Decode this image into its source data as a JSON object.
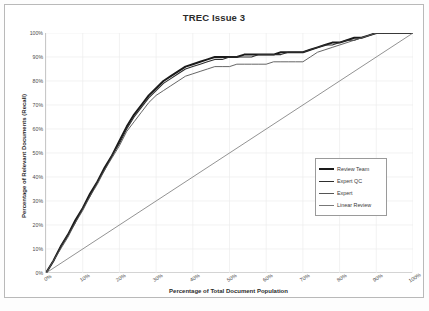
{
  "chart_data": {
    "type": "line",
    "title": "TREC Issue 3",
    "xlabel": "Percentage of Total Document Population",
    "ylabel": "Percentage of Relevant Documents (Recall)",
    "xlim": [
      0,
      100
    ],
    "ylim": [
      0,
      100
    ],
    "grid": true,
    "legend_position": "right-center",
    "xticks": [
      "0%",
      "10%",
      "20%",
      "30%",
      "40%",
      "50%",
      "60%",
      "70%",
      "80%",
      "90%",
      "100%"
    ],
    "yticks": [
      "0%",
      "10%",
      "20%",
      "30%",
      "40%",
      "50%",
      "60%",
      "70%",
      "80%",
      "90%",
      "100%"
    ],
    "series": [
      {
        "name": "Review Team",
        "color": "#1a1a1a",
        "width": 2.0,
        "x": [
          0,
          2,
          4,
          6,
          8,
          10,
          12,
          14,
          16,
          18,
          20,
          22,
          24,
          26,
          28,
          30,
          32,
          34,
          36,
          38,
          40,
          42,
          44,
          46,
          48,
          50,
          52,
          54,
          56,
          58,
          60,
          62,
          64,
          66,
          68,
          70,
          72,
          74,
          76,
          78,
          80,
          82,
          84,
          86,
          88,
          90,
          92,
          94,
          96,
          98,
          100
        ],
        "y": [
          0,
          5,
          11,
          16,
          22,
          27,
          33,
          38,
          44,
          49,
          55,
          61,
          66,
          70,
          74,
          77,
          80,
          82,
          84,
          86,
          87,
          88,
          89,
          90,
          90,
          90,
          90,
          91,
          91,
          91,
          91,
          91,
          92,
          92,
          92,
          92,
          93,
          94,
          95,
          96,
          96,
          97,
          98,
          98,
          99,
          100,
          100,
          100,
          100,
          100,
          100
        ]
      },
      {
        "name": "Expert QC",
        "color": "#2e2e2e",
        "width": 1.1,
        "x": [
          0,
          2,
          4,
          6,
          8,
          10,
          12,
          14,
          16,
          18,
          20,
          22,
          24,
          26,
          28,
          30,
          32,
          34,
          36,
          38,
          40,
          42,
          44,
          46,
          48,
          50,
          52,
          54,
          56,
          58,
          60,
          62,
          64,
          66,
          68,
          70,
          72,
          74,
          76,
          78,
          80,
          82,
          84,
          86,
          88,
          90,
          92,
          94,
          96,
          98,
          100
        ],
        "y": [
          0,
          5,
          11,
          16,
          21,
          27,
          32,
          38,
          43,
          49,
          54,
          60,
          65,
          69,
          73,
          76,
          79,
          81,
          83,
          85,
          86,
          87,
          88,
          89,
          89,
          90,
          90,
          90,
          90,
          91,
          91,
          91,
          91,
          92,
          92,
          92,
          93,
          94,
          95,
          95,
          96,
          97,
          97,
          98,
          99,
          100,
          100,
          100,
          100,
          100,
          100
        ]
      },
      {
        "name": "Expert",
        "color": "#555555",
        "width": 0.9,
        "x": [
          0,
          2,
          4,
          6,
          8,
          10,
          12,
          14,
          16,
          18,
          20,
          22,
          24,
          26,
          28,
          30,
          32,
          34,
          36,
          38,
          40,
          42,
          44,
          46,
          48,
          50,
          52,
          54,
          56,
          58,
          60,
          62,
          64,
          66,
          68,
          70,
          72,
          74,
          76,
          78,
          80,
          82,
          84,
          86,
          88,
          90,
          92,
          94,
          96,
          98,
          100
        ],
        "y": [
          0,
          5,
          10,
          15,
          21,
          26,
          32,
          37,
          43,
          48,
          53,
          59,
          63,
          67,
          71,
          74,
          76,
          78,
          80,
          82,
          83,
          84,
          85,
          86,
          86,
          86,
          87,
          87,
          87,
          87,
          87,
          88,
          88,
          88,
          88,
          88,
          90,
          92,
          93,
          94,
          95,
          96,
          97,
          98,
          99,
          100,
          100,
          100,
          100,
          100,
          100
        ]
      },
      {
        "name": "Linear Review",
        "color": "#777777",
        "width": 0.8,
        "x": [
          0,
          100
        ],
        "y": [
          0,
          100
        ]
      }
    ]
  }
}
